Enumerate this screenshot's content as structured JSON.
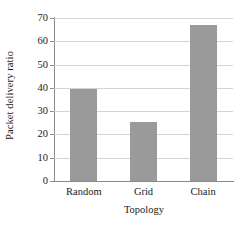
{
  "chart_data": {
    "type": "bar",
    "title": "",
    "subtitle": "",
    "xlabel": "Topology",
    "ylabel": "Packet delivery ratio",
    "categories": [
      "Random",
      "Grid",
      "Chain"
    ],
    "values": [
      39.5,
      25.5,
      67
    ],
    "series": [
      {
        "name": "Packet delivery ratio",
        "values": [
          39.5,
          25.5,
          67
        ]
      }
    ],
    "ylim": [
      0,
      70
    ],
    "yticks": [
      0,
      10,
      20,
      30,
      40,
      50,
      60,
      70
    ],
    "ytick_labels": [
      "0",
      "10",
      "20",
      "30",
      "40",
      "50",
      "60",
      "70"
    ],
    "grid": "horizontal",
    "legend": "none",
    "bar_color": "#9a9a9a",
    "grid_color": "#d4d4d4",
    "axis_color": "#8d8d8d",
    "background": "#ffffff",
    "annotations": []
  }
}
